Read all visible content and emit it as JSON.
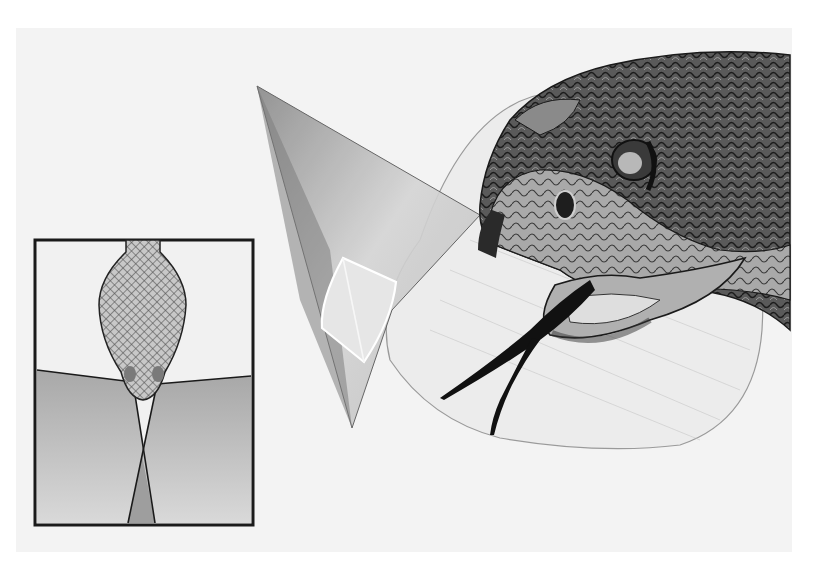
{
  "illustration": {
    "subject": "rattlesnake head with sensory field cones",
    "background_color": "#f3f3f3",
    "ink_color": "#1a1a1a",
    "inset": {
      "subject": "top-down view of snake head with overlapping pit-organ fields",
      "border_color": "#1a1a1a",
      "field_fill": "#bdbdbd",
      "head_fill": "#9a9a9a"
    },
    "main": {
      "cone_fill": "#d8d8d8",
      "bulb_fill": "#e9e9e9",
      "head_dark": "#2a2a2a",
      "head_mid": "#6a6a6a",
      "head_light": "#b5b5b5"
    }
  }
}
